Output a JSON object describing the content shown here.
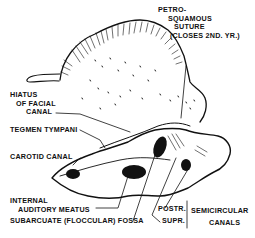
{
  "figure": {
    "ink_color": "#111111",
    "background_color": "#ffffff"
  },
  "labels": {
    "petrosquamous_1": "PETRO-",
    "petrosquamous_2": "SQUAMOUS",
    "petrosquamous_3": "SUTURE",
    "petrosquamous_4": "(CLOSES 2ND. YR.)",
    "hiatus_1": "HIATUS",
    "hiatus_2": "OF FACIAL",
    "hiatus_3": "CANAL",
    "tegmen": "TEGMEN TYMPANI",
    "carotid": "CAROTID CANAL",
    "internal_1": "INTERNAL",
    "internal_2": "AUDITORY  MEATUS",
    "subarcuate": "SUBARCUATE (FLOCCULAR) FOSSA",
    "postr": "POSTR.",
    "supr": "SUPR.",
    "semicircular_1": "SEMICIRCULAR",
    "semicircular_2": "CANALS"
  }
}
